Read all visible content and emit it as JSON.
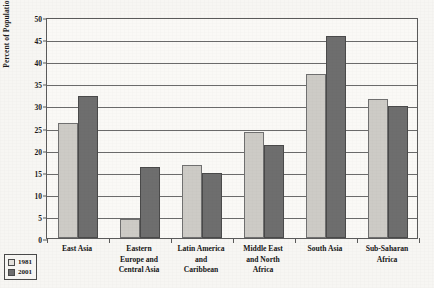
{
  "chart_data": {
    "type": "bar",
    "title": "",
    "xlabel": "",
    "ylabel": "Percent of Population",
    "ylim": [
      0,
      50
    ],
    "ytick_step": 5,
    "yticks": [
      0,
      5,
      10,
      15,
      20,
      25,
      30,
      35,
      40,
      45,
      50
    ],
    "grid": true,
    "legend_position": "bottom-left",
    "categories": [
      "East Asia",
      "Eastern Europe and Central Asia",
      "Latin America and Caribbean",
      "Middle East and North Africa",
      "South Asia",
      "Sub-Saharan Africa"
    ],
    "category_lines": [
      [
        "East Asia"
      ],
      [
        "Eastern",
        "Europe and",
        "Central Asia"
      ],
      [
        "Latin America",
        "and",
        "Caribbean"
      ],
      [
        "Middle East",
        "and North",
        "Africa"
      ],
      [
        "South Asia"
      ],
      [
        "Sub-Saharan",
        "Africa"
      ]
    ],
    "series": [
      {
        "name": "1981",
        "color": "#cdcbc6",
        "values": [
          26.1,
          4.3,
          16.5,
          24.0,
          37.0,
          31.5
        ]
      },
      {
        "name": "2001",
        "color": "#6e6e6e",
        "values": [
          32.1,
          16.1,
          14.8,
          21.0,
          45.7,
          29.8
        ]
      }
    ]
  },
  "legend": {
    "items": [
      {
        "label": "1981",
        "series": "s1981"
      },
      {
        "label": "2001",
        "series": "s2001"
      }
    ]
  }
}
